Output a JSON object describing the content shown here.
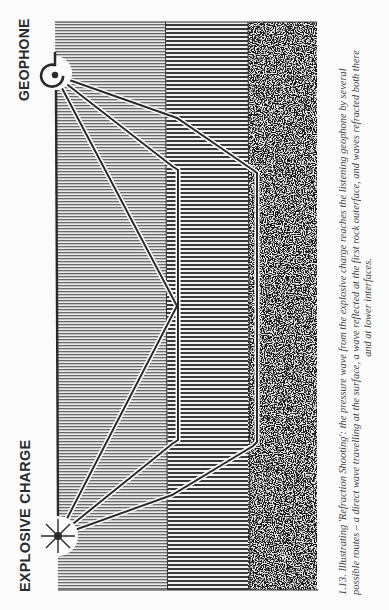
{
  "labels": {
    "geophone": "GEOPHONE",
    "explosive_charge": "EXPLOSIVE CHARGE"
  },
  "caption": {
    "line1": "1.13. Illustrating 'Refraction Shooting': the pressure wave from the explosive charge reaches the listening geophone by several",
    "line2": "possible routes – a direct wave travelling at the surface, a wave reflected at the first rock outerface, and waves refracted both there",
    "line3": "and at lower interfaces."
  },
  "layers": [
    {
      "name": "surface-layer",
      "pattern": "fine-horizontal-lines"
    },
    {
      "name": "first-rock-layer",
      "pattern": "coarse-horizontal-lines"
    },
    {
      "name": "lower-rock-layer",
      "pattern": "speckled"
    }
  ],
  "colors": {
    "ink": "#2a2a2a",
    "paper": "#fbfbfb",
    "ray_casing": "#ffffff"
  }
}
